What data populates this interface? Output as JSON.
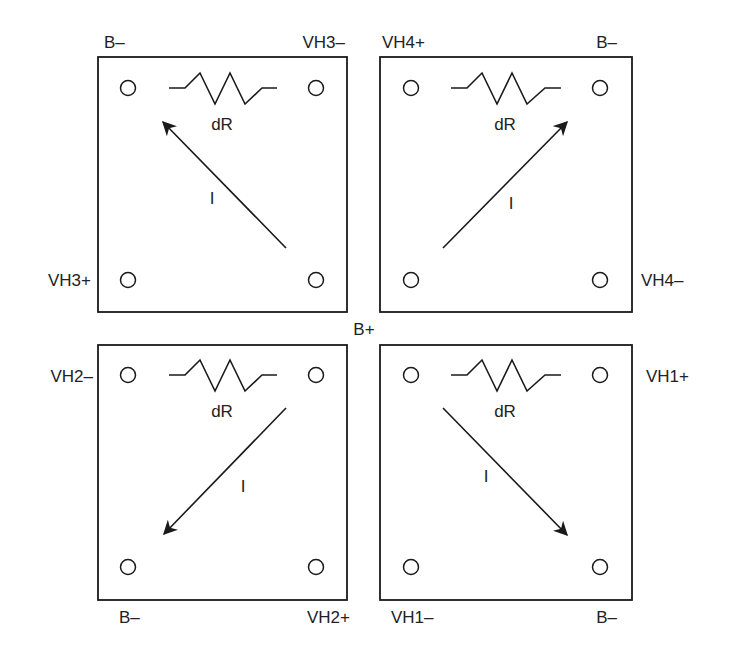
{
  "diagram": {
    "center_label": "B+",
    "resistor_label": "dR",
    "current_label": "I",
    "quadrants": [
      {
        "id": "top-left",
        "corner_labels": {
          "top_left": "B–",
          "top_right": "VH3–",
          "side_left": "VH3+",
          "side_right": "",
          "bottom_left": "",
          "bottom_right": ""
        },
        "resistor": "dR",
        "current": "I",
        "arrow_direction": "toward top-left"
      },
      {
        "id": "top-right",
        "corner_labels": {
          "top_left": "VH4+",
          "top_right": "B–",
          "side_left": "",
          "side_right": "VH4–",
          "bottom_left": "",
          "bottom_right": ""
        },
        "resistor": "dR",
        "current": "I",
        "arrow_direction": "toward top-right"
      },
      {
        "id": "bottom-left",
        "corner_labels": {
          "top_left": "",
          "top_right": "",
          "side_left": "VH2–",
          "side_right": "",
          "bottom_left": "B–",
          "bottom_right": "VH2+"
        },
        "resistor": "dR",
        "current": "I",
        "arrow_direction": "toward bottom-left"
      },
      {
        "id": "bottom-right",
        "corner_labels": {
          "top_left": "",
          "top_right": "",
          "side_left": "",
          "side_right": "VH1+",
          "bottom_left": "VH1–",
          "bottom_right": "B–"
        },
        "resistor": "dR",
        "current": "I",
        "arrow_direction": "toward bottom-right"
      }
    ],
    "colors": {
      "line": "#1a1a1a",
      "background": "#ffffff"
    }
  }
}
